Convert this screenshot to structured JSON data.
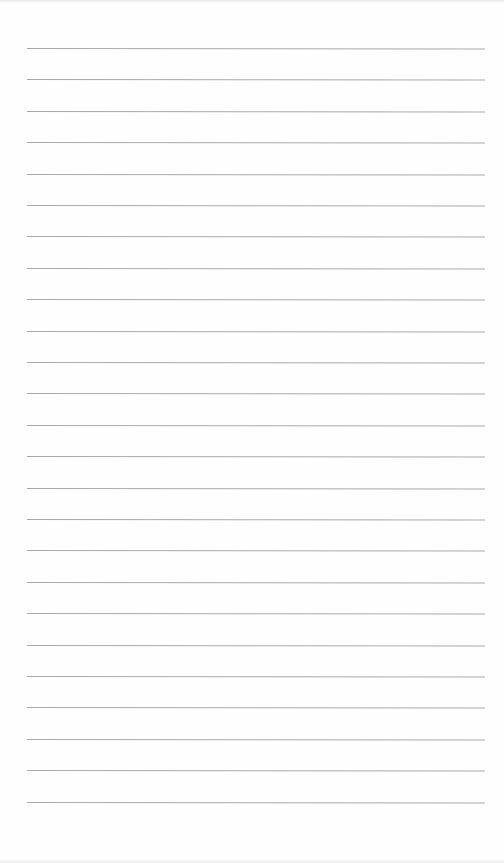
{
  "document": {
    "type": "blank lined paper",
    "line_count": 25,
    "line_color": "#a9a9a9",
    "paper_color": "#fefefe",
    "first_line_y": 48,
    "line_spacing_px": 31.4,
    "line_left_x": 27,
    "line_right_x": 485
  }
}
